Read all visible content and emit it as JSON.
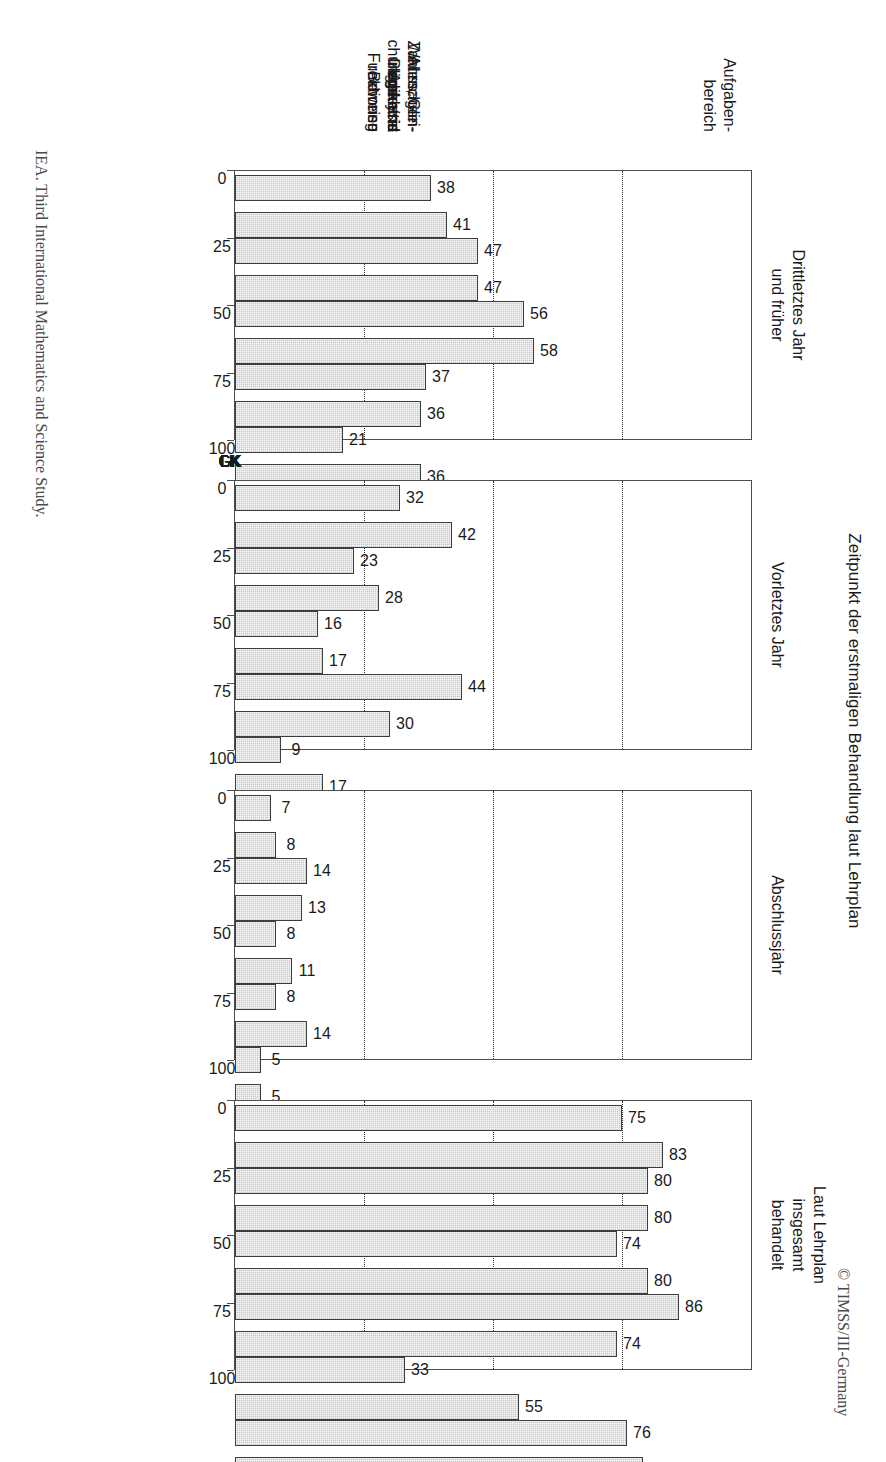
{
  "figure": {
    "title": "Zeitpunkt der erstmaligen Behandlung laut Lehrplan",
    "credit_top": "© TIMSS/III-Germany",
    "credit_bottom": "IEA. Third International Mathematics and Science Study."
  },
  "category_header": {
    "line1": "Aufgaben-",
    "line2": "bereich"
  },
  "chart_data": {
    "type": "bar",
    "title": "Zeitpunkt der erstmaligen Behandlung laut Lehrplan",
    "xlabel": "",
    "ylabel": "",
    "ylim": [
      0,
      100
    ],
    "ticks": [
      0,
      25,
      50,
      75,
      100
    ],
    "grid": true,
    "grid_values": [
      25,
      50,
      75
    ],
    "legend": "none",
    "categories": [
      "Analysis",
      "Geometrie",
      "Zahlen, Gleichungen und Funktionen",
      "Wahrscheinlichkeitsrechnung",
      "Aussagenlogik und Beweise",
      "Insgesamt"
    ],
    "subgroups": [
      "GK",
      "LK"
    ],
    "panels": [
      {
        "title_lines": [
          "Drittletztes Jahr",
          "und früher"
        ],
        "values": {
          "GK": [
            38,
            47,
            56,
            37,
            21,
            45
          ],
          "LK": [
            41,
            47,
            58,
            36,
            36,
            47
          ]
        }
      },
      {
        "title_lines": [
          "Vorletztes Jahr"
        ],
        "values": {
          "GK": [
            32,
            23,
            16,
            44,
            9,
            25
          ],
          "LK": [
            42,
            28,
            17,
            30,
            17,
            28
          ]
        }
      },
      {
        "title_lines": [
          "Abschlussjahr"
        ],
        "values": {
          "GK": [
            7,
            14,
            8,
            8,
            5,
            10
          ],
          "LK": [
            8,
            13,
            11,
            14,
            5,
            11
          ]
        }
      },
      {
        "title_lines": [
          "Laut Lehrplan",
          "insgesamt",
          "behandelt"
        ],
        "values": {
          "GK": [
            75,
            80,
            74,
            86,
            33,
            76
          ],
          "LK": [
            83,
            80,
            80,
            74,
            55,
            79
          ]
        }
      }
    ]
  },
  "category_labels": [
    {
      "lines": [
        "Analysis"
      ]
    },
    {
      "lines": [
        "Geometrie"
      ]
    },
    {
      "lines": [
        "Zahlen, Glei-",
        "chungen und",
        "Funktionen"
      ]
    },
    {
      "lines": [
        "Wahrschein-",
        "lichkeits-",
        "rechnung"
      ]
    },
    {
      "lines": [
        "Aussagen-",
        "logik und",
        "Beweise"
      ]
    },
    {
      "lines": [
        "Insgesamt"
      ]
    }
  ]
}
